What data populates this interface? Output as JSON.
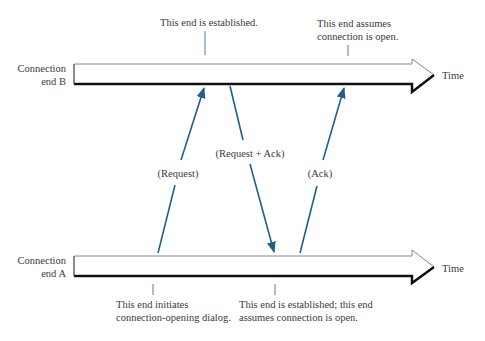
{
  "diagram": {
    "type": "sequence/timeline",
    "accent_color": "#1f5f8b",
    "timelines": [
      {
        "id": "B",
        "label_line1": "Connection",
        "label_line2": "end B",
        "axis_label": "Time"
      },
      {
        "id": "A",
        "label_line1": "Connection",
        "label_line2": "end A",
        "axis_label": "Time"
      }
    ],
    "messages": [
      {
        "label": "(Request)",
        "from": "A",
        "to": "B"
      },
      {
        "label": "(Request + Ack)",
        "from": "B",
        "to": "A"
      },
      {
        "label": "(Ack)",
        "from": "A",
        "to": "B"
      }
    ],
    "annotations": {
      "b_established": "This end is established.",
      "b_assumes_line1": "This end assumes",
      "b_assumes_line2": "connection is open.",
      "a_initiates_line1": "This end initiates",
      "a_initiates_line2": "connection-opening dialog.",
      "a_established_line1": "This end is established; this end",
      "a_established_line2": "assumes connection is open."
    }
  }
}
